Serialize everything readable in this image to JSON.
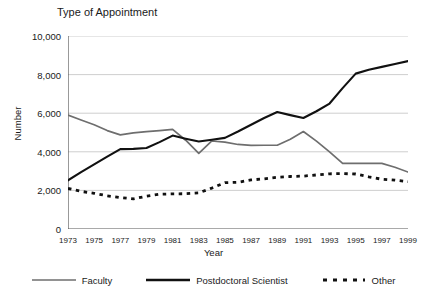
{
  "chart_data": {
    "type": "line",
    "title": "Type of Appointment",
    "xlabel": "Year",
    "ylabel": "Number",
    "x": [
      1973,
      1974,
      1975,
      1976,
      1977,
      1978,
      1979,
      1980,
      1981,
      1982,
      1983,
      1984,
      1985,
      1986,
      1987,
      1988,
      1989,
      1990,
      1991,
      1992,
      1993,
      1994,
      1995,
      1996,
      1997,
      1998,
      1999
    ],
    "xticks": [
      1973,
      1975,
      1977,
      1979,
      1981,
      1983,
      1985,
      1987,
      1989,
      1991,
      1993,
      1995,
      1997,
      1999
    ],
    "xlim": [
      1973,
      1999
    ],
    "ylim": [
      0,
      10000
    ],
    "yticks": [
      0,
      2000,
      4000,
      6000,
      8000,
      10000
    ],
    "ytick_labels": [
      "0",
      "2,000",
      "4,000",
      "6,000",
      "8,000",
      "10,000"
    ],
    "grid": true,
    "legend_position": "bottom",
    "series": [
      {
        "name": "Faculty",
        "color": "#6e6e6e",
        "style": "solid",
        "values": [
          5900,
          5650,
          5400,
          5100,
          4880,
          4980,
          5050,
          5100,
          5160,
          4600,
          3920,
          4560,
          4500,
          4380,
          4330,
          4340,
          4340,
          4650,
          5050,
          4550,
          4000,
          3400,
          3400,
          3400,
          3400,
          3200,
          2950
        ]
      },
      {
        "name": "Postdoctoral Scientist",
        "color": "#111111",
        "style": "solid",
        "values": [
          2520,
          2950,
          3350,
          3750,
          4140,
          4150,
          4200,
          4500,
          4840,
          4680,
          4530,
          4620,
          4720,
          5050,
          5400,
          5750,
          6060,
          5900,
          5750,
          6100,
          6500,
          7300,
          8050,
          8250,
          8400,
          8550,
          8700
        ]
      },
      {
        "name": "Other",
        "color": "#111111",
        "style": "dashed",
        "values": [
          2100,
          1950,
          1850,
          1720,
          1630,
          1560,
          1700,
          1800,
          1820,
          1830,
          1870,
          2120,
          2400,
          2420,
          2540,
          2600,
          2680,
          2720,
          2740,
          2800,
          2860,
          2870,
          2850,
          2700,
          2580,
          2530,
          2450
        ]
      }
    ]
  },
  "legend": {
    "items": [
      {
        "label": "Faculty"
      },
      {
        "label": "Postdoctoral Scientist"
      },
      {
        "label": "Other"
      }
    ]
  }
}
